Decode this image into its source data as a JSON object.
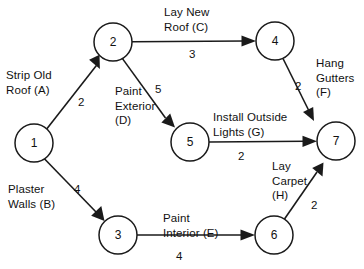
{
  "diagram": {
    "type": "activity-on-arrow-network",
    "nodes": [
      {
        "id": "1",
        "label": "1",
        "cx": 34,
        "cy": 143,
        "r": 19
      },
      {
        "id": "2",
        "label": "2",
        "cx": 113,
        "cy": 42,
        "r": 19
      },
      {
        "id": "3",
        "label": "3",
        "cx": 118,
        "cy": 235,
        "r": 19
      },
      {
        "id": "4",
        "label": "4",
        "cx": 275,
        "cy": 41,
        "r": 19
      },
      {
        "id": "5",
        "label": "5",
        "cx": 190,
        "cy": 142,
        "r": 19
      },
      {
        "id": "6",
        "label": "6",
        "cx": 274,
        "cy": 235,
        "r": 19
      },
      {
        "id": "7",
        "label": "7",
        "cx": 336,
        "cy": 141,
        "r": 19
      }
    ],
    "edges": [
      {
        "id": "A",
        "from": "1",
        "to": "2",
        "activity": "Strip Old\nRoof (A)",
        "duration": "2"
      },
      {
        "id": "B",
        "from": "1",
        "to": "3",
        "activity": "Plaster\nWalls (B)",
        "duration": "4"
      },
      {
        "id": "C",
        "from": "2",
        "to": "4",
        "activity": "Lay New\nRoof (C)",
        "duration": "3"
      },
      {
        "id": "D",
        "from": "2",
        "to": "5",
        "activity": "Paint\nExterior\n(D)",
        "duration": "5"
      },
      {
        "id": "E",
        "from": "3",
        "to": "6",
        "activity": "Paint\nInterior (E)",
        "duration": "4"
      },
      {
        "id": "F",
        "from": "4",
        "to": "7",
        "activity": "Hang\nGutters\n(F)",
        "duration": "2"
      },
      {
        "id": "G",
        "from": "5",
        "to": "7",
        "activity": "Install Outside\nLights (G)",
        "duration": "2"
      },
      {
        "id": "H",
        "from": "6",
        "to": "7",
        "activity": "Lay\nCarpet\n(H)",
        "duration": "2"
      }
    ],
    "colors": {
      "stroke": "#1a1a1a",
      "background": "#ffffff",
      "text": "#111111"
    }
  }
}
